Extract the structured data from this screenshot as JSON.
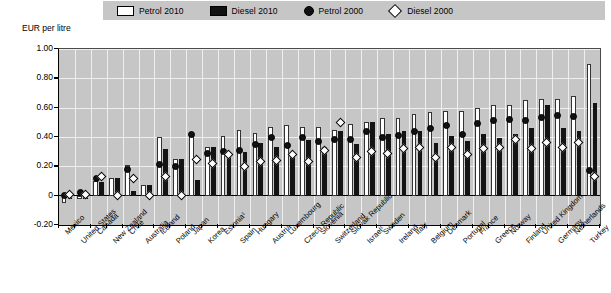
{
  "legend": {
    "items": [
      {
        "label": "Petrol 2010",
        "marker": "open-rect-swatch",
        "color": "#ffffff"
      },
      {
        "label": "Diesel 2010",
        "marker": "solid-rect-swatch",
        "color": "#141414"
      },
      {
        "label": "Petrol 2000",
        "marker": "filled-circle-marker",
        "color": "#111111"
      },
      {
        "label": "Diesel 2000",
        "marker": "open-diamond-marker",
        "color": "#ffffff"
      }
    ]
  },
  "axis": {
    "y_title": "EUR per litre",
    "y_ticks": [
      "1.00",
      "0.80",
      "0.60",
      "0.40",
      "0.20",
      "0",
      "-0.20"
    ]
  },
  "chart_data": {
    "type": "bar",
    "title": "",
    "subtitle": "",
    "xlabel": "",
    "ylabel": "EUR per litre",
    "ylim": [
      -0.2,
      1.0
    ],
    "ytick_values": [
      1.0,
      0.8,
      0.6,
      0.4,
      0.2,
      0,
      -0.2
    ],
    "grid": true,
    "legend_position": "top",
    "categories": [
      "Mexico",
      "United States",
      "Canada",
      "New Zealand",
      "Chile",
      "Australia",
      "Iceland",
      "Poland",
      "Japan",
      "Korea",
      "Estonia¹",
      "Spain",
      "Hungary",
      "Austria",
      "Luxembourg",
      "Czech Republic",
      "Slovenia",
      "Switzerland",
      "Slovak Republic",
      "Israel¹",
      "Sweden",
      "Ireland",
      "Italy",
      "Belgium",
      "Denmark",
      "Portugal",
      "France",
      "Greece",
      "Norway",
      "Finland",
      "United Kingdom",
      "Germany",
      "Netherlands",
      "Turkey"
    ],
    "series": [
      {
        "name": "Petrol 2010",
        "type": "bar",
        "color": "#ffffff",
        "values": [
          -0.05,
          -0.02,
          0.1,
          0.12,
          0.21,
          0.07,
          0.4,
          0.25,
          0.42,
          0.33,
          0.41,
          0.45,
          0.43,
          0.47,
          0.48,
          0.47,
          0.47,
          0.45,
          0.49,
          0.5,
          0.53,
          0.53,
          0.56,
          0.57,
          0.58,
          0.58,
          0.6,
          0.62,
          0.62,
          0.65,
          0.66,
          0.66,
          0.68,
          0.9
        ]
      },
      {
        "name": "Diesel 2010",
        "type": "bar",
        "color": "#141414",
        "values": [
          -0.02,
          -0.02,
          0.09,
          0.12,
          0.03,
          0.07,
          0.32,
          0.25,
          0.11,
          0.33,
          0.27,
          0.3,
          0.36,
          0.33,
          0.3,
          0.38,
          0.33,
          0.44,
          0.35,
          0.5,
          0.42,
          0.44,
          0.44,
          0.36,
          0.41,
          0.37,
          0.42,
          0.39,
          0.42,
          0.46,
          0.62,
          0.46,
          0.44,
          0.63
        ]
      },
      {
        "name": "Petrol 2000",
        "type": "scatter",
        "color": "#111111",
        "values": [
          0.0,
          0.02,
          0.12,
          null,
          0.18,
          null,
          0.21,
          0.2,
          0.42,
          0.29,
          0.3,
          0.31,
          0.35,
          0.4,
          0.34,
          0.4,
          0.37,
          0.38,
          0.38,
          0.44,
          0.4,
          0.41,
          0.44,
          0.46,
          0.48,
          0.42,
          0.49,
          0.51,
          0.52,
          0.51,
          0.53,
          0.55,
          0.54,
          0.17
        ]
      },
      {
        "name": "Diesel 2000",
        "type": "scatter",
        "color": "#ffffff",
        "values": [
          0.01,
          0.01,
          0.13,
          0.0,
          0.12,
          0.0,
          0.13,
          0.0,
          0.25,
          0.22,
          0.28,
          0.2,
          0.23,
          0.24,
          0.28,
          0.23,
          0.31,
          0.5,
          0.26,
          0.3,
          0.29,
          0.32,
          0.33,
          0.26,
          0.33,
          0.28,
          0.32,
          0.33,
          0.38,
          0.32,
          0.36,
          0.33,
          0.36,
          0.13
        ]
      }
    ]
  }
}
